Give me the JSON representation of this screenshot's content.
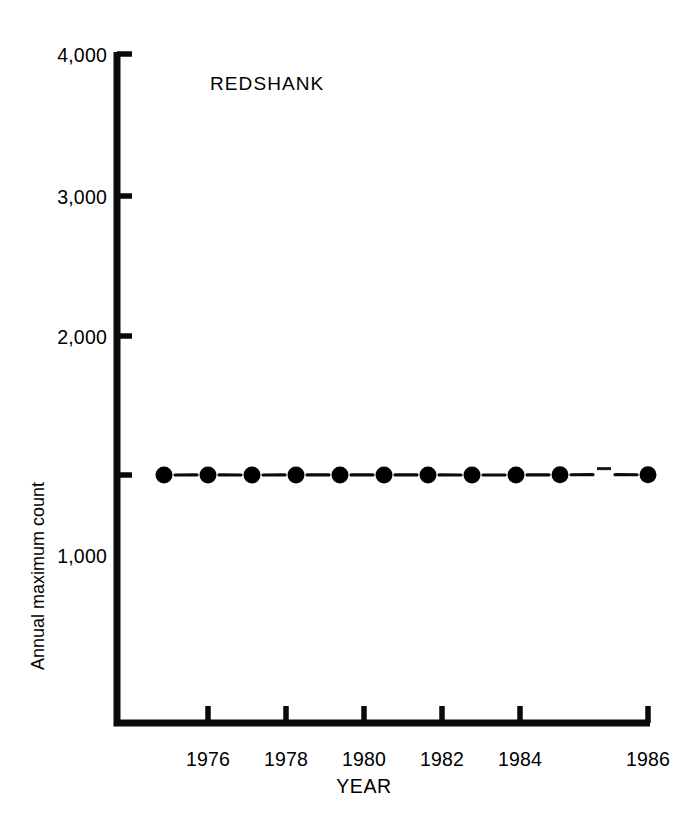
{
  "chart_data": {
    "type": "line",
    "title": "REDSHANK",
    "xlabel": "YEAR",
    "ylabel": "Annual maximum count",
    "x": [
      1975,
      1976,
      1977,
      1978,
      1979,
      1980,
      1981,
      1982,
      1983,
      1984,
      1985,
      1986
    ],
    "values": [
      820,
      1505,
      810,
      1680,
      1450,
      1580,
      1510,
      1060,
      920,
      2320,
      3620,
      2550
    ],
    "series": [
      {
        "name": "Redshank annual maximum count",
        "values": [
          820,
          1505,
          810,
          1680,
          1450,
          1580,
          1510,
          1060,
          920,
          2320,
          3620,
          2550
        ]
      }
    ],
    "xlim": [
      1974.3,
      1987.0
    ],
    "ylim": [
      0,
      4000
    ],
    "ytick_values": [
      1000,
      2000,
      3000,
      4000
    ],
    "ytick_labels": [
      "1,000",
      "2,000",
      "3,000",
      "4,000"
    ],
    "xtick_values": [
      1976,
      1978,
      1980,
      1982,
      1984,
      1986
    ],
    "xtick_labels": [
      "1976",
      "1978",
      "1980",
      "1982",
      "1984",
      "1986"
    ],
    "grid": false,
    "legend": "none",
    "marker": "filled-circle",
    "line_color": "#000000",
    "marker_color": "#000000",
    "background_color": "#ffffff"
  },
  "axis": {
    "y_axis_name": "y-axis",
    "x_axis_name": "x-axis"
  }
}
